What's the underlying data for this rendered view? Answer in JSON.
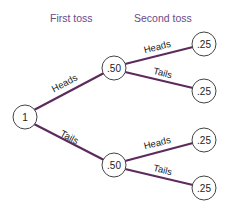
{
  "headers": {
    "first": "First toss",
    "second": "Second toss"
  },
  "colors": {
    "edge": "#5c2a5c",
    "header_text": "#6a4a8a"
  },
  "tree": {
    "root": {
      "label": "1"
    },
    "first_level": [
      {
        "edge": "Heads",
        "label": ".50",
        "children": [
          {
            "edge": "Heads",
            "label": ".25"
          },
          {
            "edge": "Tails",
            "label": ".25"
          }
        ]
      },
      {
        "edge": "Tails",
        "label": ".50",
        "children": [
          {
            "edge": "Heads",
            "label": ".25"
          },
          {
            "edge": "Tails",
            "label": ".25"
          }
        ]
      }
    ]
  }
}
